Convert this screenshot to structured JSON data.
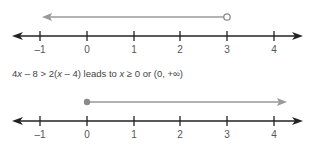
{
  "figure": {
    "caption": {
      "parts": [
        "4",
        "x",
        " – 8 > 2(",
        "x",
        " – 4) leads to ",
        "x",
        " ≥ 0 or (0, +∞)"
      ]
    },
    "number_lines": [
      {
        "name": "top",
        "ticks": [
          "–1",
          "0",
          "1",
          "2",
          "3",
          "4"
        ],
        "ray": {
          "from": 3,
          "direction": "left",
          "endpoint": "open"
        }
      },
      {
        "name": "bottom",
        "ticks": [
          "–1",
          "0",
          "1",
          "2",
          "3",
          "4"
        ],
        "ray": {
          "from": 0,
          "direction": "right",
          "endpoint": "closed"
        }
      }
    ],
    "colors": {
      "axis": "#222222",
      "ray": "#999999",
      "text": "#444444"
    }
  }
}
